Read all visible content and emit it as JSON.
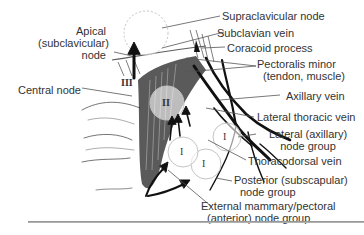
{
  "diagram": {
    "labels": {
      "supraclavicular": "Supraclavicular node",
      "apical_1": "Apical",
      "apical_2": "(subclavicular)",
      "apical_3": "node",
      "subclavian": "Subclavian vein",
      "coracoid": "Coracoid process",
      "pectoralis_1": "Pectoralis minor",
      "pectoralis_2": "(tendon, muscle)",
      "central": "Central node",
      "axillary_vein": "Axillary vein",
      "lateral_thoracic": "Lateral thoracic vein",
      "lateral_group_1": "Lateral (axillary)",
      "lateral_group_2": "node group",
      "thoracodorsal": "Thoracodorsal vein",
      "posterior_1": "Posterior (subscapular)",
      "posterior_2": "node group",
      "external_1": "External mammary/pectoral",
      "external_2": "(anterior) node group"
    },
    "node_levels": {
      "level_3": "III",
      "level_2": "II",
      "level_1a": "I",
      "level_1b": "I",
      "level_1c": "I"
    },
    "colors": {
      "ink": "#1a1a1a",
      "label_text": "#333333",
      "node_circle": "#c8c8c8",
      "rule": "#9a9a9a"
    }
  }
}
